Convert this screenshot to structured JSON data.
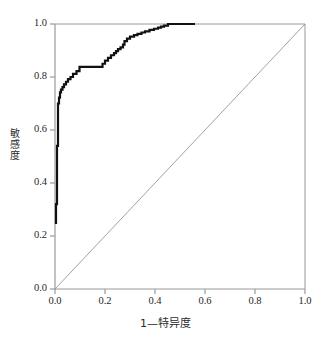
{
  "chart_data": {
    "type": "line",
    "title": "",
    "xlabel": "1—特异度",
    "ylabel": "敏感度",
    "xlim": [
      0.0,
      1.0
    ],
    "ylim": [
      0.0,
      1.0
    ],
    "grid": false,
    "legend": "none",
    "xticks": [
      "0.0",
      "0.2",
      "0.4",
      "0.6",
      "0.8",
      "1.0"
    ],
    "xtick_values": [
      0.0,
      0.2,
      0.4,
      0.6,
      0.8,
      1.0
    ],
    "yticks": [
      "0.0",
      "0.2",
      "0.4",
      "0.6",
      "0.8",
      "1.0"
    ],
    "ytick_values": [
      0.0,
      0.2,
      0.4,
      0.6,
      0.8,
      1.0
    ],
    "series": [
      {
        "name": "ROC curve",
        "color": "#111111",
        "linewidth": 2.2,
        "points": [
          [
            0.004,
            0.245
          ],
          [
            0.004,
            0.285
          ],
          [
            0.004,
            0.32
          ],
          [
            0.008,
            0.32
          ],
          [
            0.008,
            0.36
          ],
          [
            0.008,
            0.42
          ],
          [
            0.008,
            0.48
          ],
          [
            0.008,
            0.54
          ],
          [
            0.012,
            0.54
          ],
          [
            0.012,
            0.58
          ],
          [
            0.012,
            0.625
          ],
          [
            0.012,
            0.665
          ],
          [
            0.012,
            0.7
          ],
          [
            0.016,
            0.7
          ],
          [
            0.016,
            0.722
          ],
          [
            0.02,
            0.722
          ],
          [
            0.02,
            0.742
          ],
          [
            0.024,
            0.742
          ],
          [
            0.024,
            0.752
          ],
          [
            0.03,
            0.752
          ],
          [
            0.03,
            0.762
          ],
          [
            0.036,
            0.762
          ],
          [
            0.036,
            0.772
          ],
          [
            0.044,
            0.772
          ],
          [
            0.044,
            0.782
          ],
          [
            0.052,
            0.782
          ],
          [
            0.052,
            0.792
          ],
          [
            0.062,
            0.792
          ],
          [
            0.062,
            0.8
          ],
          [
            0.072,
            0.8
          ],
          [
            0.072,
            0.812
          ],
          [
            0.086,
            0.812
          ],
          [
            0.086,
            0.822
          ],
          [
            0.098,
            0.822
          ],
          [
            0.098,
            0.838
          ],
          [
            0.19,
            0.838
          ],
          [
            0.19,
            0.85
          ],
          [
            0.2,
            0.85
          ],
          [
            0.2,
            0.862
          ],
          [
            0.212,
            0.862
          ],
          [
            0.212,
            0.872
          ],
          [
            0.224,
            0.872
          ],
          [
            0.224,
            0.882
          ],
          [
            0.236,
            0.882
          ],
          [
            0.236,
            0.89
          ],
          [
            0.244,
            0.89
          ],
          [
            0.244,
            0.898
          ],
          [
            0.252,
            0.898
          ],
          [
            0.252,
            0.905
          ],
          [
            0.262,
            0.905
          ],
          [
            0.262,
            0.912
          ],
          [
            0.272,
            0.912
          ],
          [
            0.272,
            0.922
          ],
          [
            0.278,
            0.922
          ],
          [
            0.278,
            0.935
          ],
          [
            0.288,
            0.935
          ],
          [
            0.288,
            0.945
          ],
          [
            0.3,
            0.945
          ],
          [
            0.3,
            0.952
          ],
          [
            0.316,
            0.952
          ],
          [
            0.316,
            0.958
          ],
          [
            0.33,
            0.958
          ],
          [
            0.33,
            0.963
          ],
          [
            0.346,
            0.963
          ],
          [
            0.346,
            0.968
          ],
          [
            0.36,
            0.968
          ],
          [
            0.36,
            0.972
          ],
          [
            0.378,
            0.972
          ],
          [
            0.378,
            0.978
          ],
          [
            0.396,
            0.978
          ],
          [
            0.396,
            0.982
          ],
          [
            0.412,
            0.982
          ],
          [
            0.412,
            0.986
          ],
          [
            0.424,
            0.986
          ],
          [
            0.424,
            0.99
          ],
          [
            0.436,
            0.99
          ],
          [
            0.436,
            0.994
          ],
          [
            0.452,
            0.994
          ],
          [
            0.452,
            1.0
          ],
          [
            0.56,
            1.0
          ]
        ]
      },
      {
        "name": "reference diagonal",
        "color": "#8a8a8a",
        "linewidth": 0.8,
        "points": [
          [
            0.0,
            0.0
          ],
          [
            1.0,
            1.0
          ]
        ]
      }
    ]
  },
  "axes": {
    "frame_color": "#9a9a9a",
    "tick_color": "#9a9a9a"
  }
}
